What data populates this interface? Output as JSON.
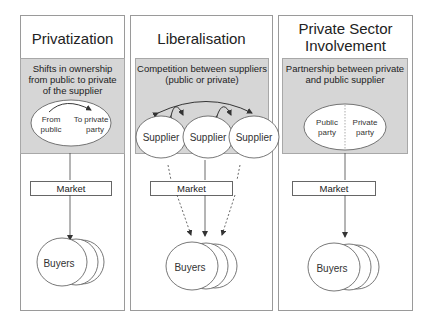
{
  "panels": [
    {
      "title_lines": [
        "Privatization"
      ],
      "description_lines": [
        "Shifts in ownership",
        "from public to private",
        "of the supplier"
      ],
      "ellipse_labels": {
        "left": [
          "From",
          "public"
        ],
        "right": [
          "To private",
          "party"
        ]
      },
      "market_label": "Market",
      "buyers_label": "Buyers"
    },
    {
      "title_lines": [
        "Liberalisation"
      ],
      "description_lines": [
        "Competition between suppliers",
        "(public or private)"
      ],
      "suppliers": [
        "Supplier",
        "Supplier",
        "Supplier"
      ],
      "market_label": "Market",
      "buyers_label": "Buyers"
    },
    {
      "title_lines": [
        "Private Sector",
        "Involvement"
      ],
      "description_lines": [
        "Partnership between private",
        "and public supplier"
      ],
      "ellipse_labels": {
        "left": [
          "Public",
          "party"
        ],
        "right": [
          "Private",
          "party"
        ]
      },
      "market_label": "Market",
      "buyers_label": "Buyers"
    }
  ],
  "colors": {
    "panel_border": "#9a9a9a",
    "gray_box": "#d6d6d6",
    "line": "#333333"
  }
}
